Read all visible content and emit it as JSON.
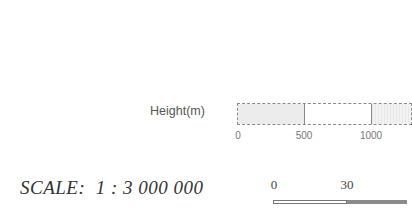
{
  "height_legend": {
    "label": "Height(m)",
    "ticks": [
      {
        "label": "0",
        "x": 238
      },
      {
        "label": "500",
        "x": 304
      },
      {
        "label": "1000",
        "x": 371
      }
    ],
    "colors": [
      "#ececec",
      "#ffffff",
      "#eeeeee"
    ]
  },
  "scale": {
    "text": "SCALE:  1 : 3 000 000",
    "bar_ticks": [
      {
        "label": "0",
        "x": 274
      },
      {
        "label": "30",
        "x": 347
      }
    ]
  }
}
